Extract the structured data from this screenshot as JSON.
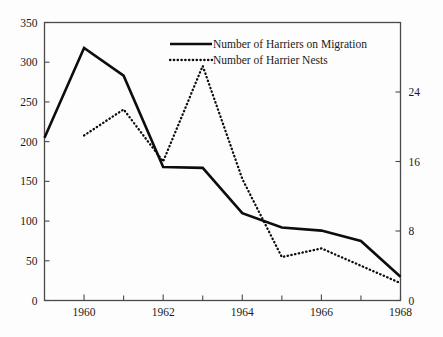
{
  "chart_data": {
    "type": "line",
    "title": "",
    "subtitle": "",
    "xlabel": "",
    "ylabel": "",
    "y2label": "",
    "grid": false,
    "legend_position": "top-center",
    "x": [
      1959,
      1960,
      1961,
      1962,
      1963,
      1964,
      1965,
      1966,
      1967,
      1968
    ],
    "xlim": [
      1959,
      1968
    ],
    "xticks_major": [
      1960,
      1962,
      1964,
      1966,
      1968
    ],
    "xticks_minor": [
      1959,
      1961,
      1963,
      1965,
      1967
    ],
    "xtick_labels": [
      "1960",
      "1962",
      "1964",
      "1966",
      "1968"
    ],
    "ylim": [
      0,
      350
    ],
    "yticks": [
      0,
      50,
      100,
      150,
      200,
      250,
      300,
      350
    ],
    "ytick_labels": [
      "0",
      "50",
      "100",
      "150",
      "200",
      "250",
      "300",
      "350"
    ],
    "y2lim": [
      0,
      32
    ],
    "y2ticks": [
      0,
      8,
      16,
      24
    ],
    "y2tick_labels": [
      "0",
      "8",
      "16",
      "24"
    ],
    "series": [
      {
        "name": "Number of Harriers on Migration",
        "style": "solid",
        "axis": "left",
        "color": "#0d0d0d",
        "x": [
          1959,
          1960,
          1961,
          1962,
          1963,
          1964,
          1965,
          1966,
          1967,
          1968
        ],
        "values": [
          205,
          318,
          283,
          168,
          167,
          110,
          92,
          88,
          75,
          30
        ]
      },
      {
        "name": "Number of Harrier Nests",
        "style": "dotted",
        "axis": "right",
        "color": "#0d0d0d",
        "x": [
          1960,
          1961,
          1962,
          1963,
          1964,
          1965,
          1966,
          1967,
          1968
        ],
        "values": [
          19,
          22,
          16,
          27,
          14,
          5,
          6,
          4,
          2
        ]
      }
    ],
    "legend": [
      {
        "label": "Number of Harriers on Migration",
        "style": "solid"
      },
      {
        "label": "Number of Harrier Nests",
        "style": "dotted"
      }
    ]
  },
  "colors": {
    "background": "#fdfdfd",
    "axis": "#4a4a4a",
    "ink": "#0d0d0d"
  }
}
